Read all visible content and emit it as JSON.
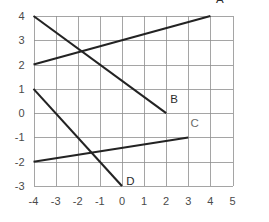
{
  "chart_data": {
    "type": "line",
    "title": "",
    "subtitle": "",
    "xlabel": "",
    "ylabel": "",
    "xlim": [
      -4,
      5
    ],
    "ylim": [
      -3,
      4
    ],
    "grid": true,
    "legend": "none",
    "xticks": [
      "-4",
      "-3",
      "-2",
      "-1",
      "0",
      "1",
      "2",
      "3",
      "4",
      "5"
    ],
    "xtick_values": [
      -4,
      -3,
      -2,
      -1,
      0,
      1,
      2,
      3,
      4,
      5
    ],
    "yticks": [
      "4",
      "3",
      "2",
      "1",
      "0",
      "-1",
      "-2",
      "-3"
    ],
    "ytick_values": [
      4,
      3,
      2,
      1,
      0,
      -1,
      -2,
      -3
    ],
    "series": [
      {
        "name": "A",
        "label": "A",
        "x": [
          -4,
          4
        ],
        "y": [
          2,
          4
        ],
        "slope": 0.25,
        "intercept": 3,
        "label_x": 4.25,
        "label_y": 4.55,
        "faint": false
      },
      {
        "name": "B",
        "label": "B",
        "x": [
          -4,
          2
        ],
        "y": [
          4,
          0
        ],
        "slope": -0.6667,
        "intercept": 1.3333,
        "label_x": 2.18,
        "label_y": 0.42,
        "faint": false
      },
      {
        "name": "C",
        "label": "C",
        "x": [
          -4,
          3
        ],
        "y": [
          -2,
          -1
        ],
        "slope": 0.1429,
        "intercept": -1.4286,
        "label_x": 3.1,
        "label_y": -0.55,
        "faint": true
      },
      {
        "name": "D",
        "label": "D",
        "x": [
          -4,
          0
        ],
        "y": [
          1,
          -3
        ],
        "slope": -1,
        "intercept": -3,
        "label_x": 0.2,
        "label_y": -2.95,
        "faint": false
      }
    ]
  },
  "axes": {
    "x_axis_name": "x-axis",
    "y_axis_name": "y-axis"
  }
}
